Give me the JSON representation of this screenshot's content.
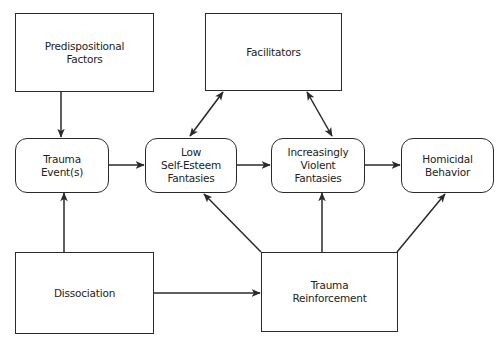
{
  "diagram": {
    "nodes": {
      "predispositional": {
        "label": "Predispositional\nFactors",
        "shape": "rectangle"
      },
      "facilitators": {
        "label": "Facilitators",
        "shape": "rectangle"
      },
      "trauma_events": {
        "label": "Trauma\nEvent(s)",
        "shape": "rounded"
      },
      "low_self_esteem": {
        "label": "Low\nSelf-Esteem\nFantasies",
        "shape": "rounded"
      },
      "violent_fantasies": {
        "label": "Increasingly\nViolent\nFantasies",
        "shape": "rounded"
      },
      "homicidal": {
        "label": "Homicidal\nBehavior",
        "shape": "rounded"
      },
      "dissociation": {
        "label": "Dissociation",
        "shape": "rectangle"
      },
      "trauma_reinforcement": {
        "label": "Trauma\nReinforcement",
        "shape": "rectangle"
      }
    },
    "edges": [
      {
        "from": "predispositional",
        "to": "trauma_events",
        "type": "directed"
      },
      {
        "from": "dissociation",
        "to": "trauma_events",
        "type": "directed"
      },
      {
        "from": "trauma_events",
        "to": "low_self_esteem",
        "type": "directed"
      },
      {
        "from": "low_self_esteem",
        "to": "violent_fantasies",
        "type": "directed"
      },
      {
        "from": "violent_fantasies",
        "to": "homicidal",
        "type": "directed"
      },
      {
        "from": "facilitators",
        "to": "low_self_esteem",
        "type": "bidirectional"
      },
      {
        "from": "facilitators",
        "to": "violent_fantasies",
        "type": "bidirectional"
      },
      {
        "from": "dissociation",
        "to": "trauma_reinforcement",
        "type": "directed"
      },
      {
        "from": "trauma_reinforcement",
        "to": "low_self_esteem",
        "type": "directed"
      },
      {
        "from": "trauma_reinforcement",
        "to": "violent_fantasies",
        "type": "directed"
      },
      {
        "from": "trauma_reinforcement",
        "to": "homicidal",
        "type": "directed"
      }
    ],
    "colors": {
      "stroke": "#2a2a2a",
      "background": "#ffffff"
    }
  }
}
